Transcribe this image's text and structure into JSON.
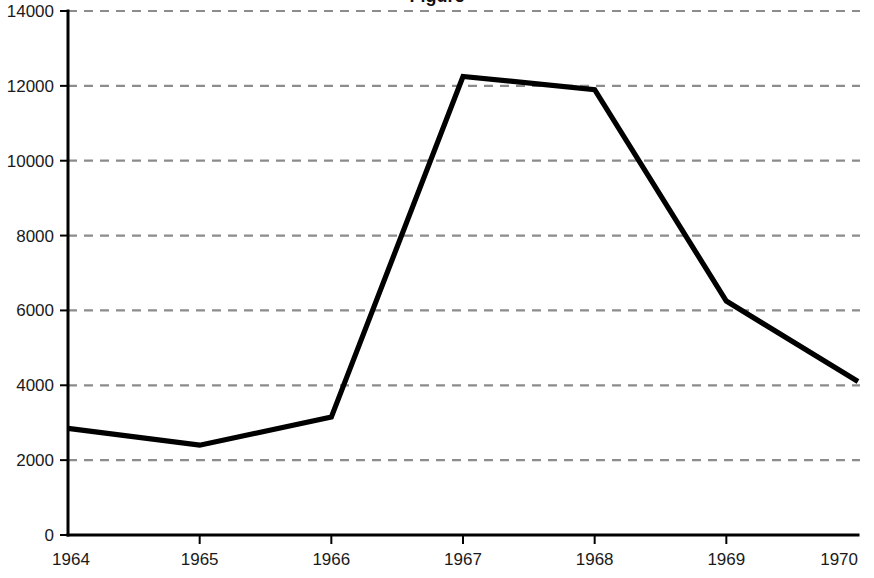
{
  "chart_data": {
    "type": "line",
    "title": "Figure",
    "title_visible": false,
    "xlabel": "",
    "ylabel": "",
    "categories": [
      1964,
      1965,
      1966,
      1967,
      1968,
      1969,
      1970
    ],
    "x_tick_labels": [
      "1964",
      "1965",
      "1966",
      "1967",
      "1968",
      "1969",
      "1970"
    ],
    "y_tick_labels": [
      "0",
      "2000",
      "4000",
      "6000",
      "8000",
      "10000",
      "12000",
      "14000"
    ],
    "y_ticks": [
      0,
      2000,
      4000,
      6000,
      8000,
      10000,
      12000,
      14000
    ],
    "xlim": [
      1964,
      1970
    ],
    "ylim": [
      0,
      14000
    ],
    "grid": true,
    "grid_axis": "y",
    "grid_style": "dashed",
    "grid_color": "#8c8c8c",
    "legend": false,
    "legend_position": "none",
    "line_color": "#000000",
    "axis_color": "#000000",
    "background_color": "#ffffff",
    "series": [
      {
        "name": "series-1",
        "values": [
          2850,
          2400,
          3150,
          12250,
          11900,
          6250,
          4100
        ]
      }
    ]
  }
}
